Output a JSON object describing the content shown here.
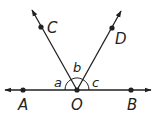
{
  "diagram": {
    "colors": {
      "stroke": "#231f20",
      "background": "#ffffff"
    },
    "points": [
      {
        "name": "A",
        "label": "A"
      },
      {
        "name": "O",
        "label": "O"
      },
      {
        "name": "B",
        "label": "B"
      },
      {
        "name": "C",
        "label": "C"
      },
      {
        "name": "D",
        "label": "D"
      }
    ],
    "angles": [
      {
        "name": "a",
        "label": "a"
      },
      {
        "name": "b",
        "label": "b"
      },
      {
        "name": "c",
        "label": "c"
      }
    ],
    "lines": [
      "line AB",
      "ray OC",
      "ray OD"
    ]
  }
}
